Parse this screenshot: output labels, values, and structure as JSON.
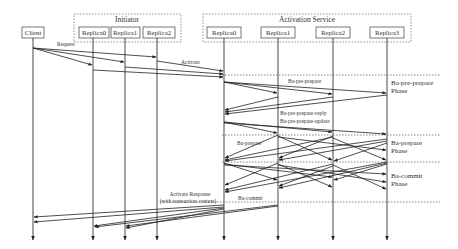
{
  "diagram": {
    "type": "sequence-diagram",
    "groups": {
      "initiator": {
        "title": "Initiator"
      },
      "activation_service": {
        "title": "Activation Service"
      }
    },
    "participants": {
      "client": "Client",
      "init_replica0": "Replica0",
      "init_replica1": "Replica1",
      "init_replica2": "Replica2",
      "act_replica0": "Replica0",
      "act_replica1": "Replica1",
      "act_replica2": "Replica2",
      "act_replica3": "Replica3"
    },
    "messages": {
      "request": "Request",
      "activate": "Activate",
      "ba_pre_prepare": "Ba-pre-prepare",
      "ba_pre_prepare_reply": "Ba-pre-prepare-reply",
      "ba_pre_prepare_update": "Ba-pre-prepare-update",
      "ba_prepare": "Ba-prepare",
      "ba_commit": "Ba-commit",
      "activate_response_line1": "Activate Response",
      "activate_response_line2": "(with transaction context)"
    },
    "phases": {
      "pre_prepare_line1": "Ba-pre-prepare",
      "pre_prepare_line2": "Phase",
      "prepare_line1": "Ba-prepare",
      "prepare_line2": "Phase",
      "commit_line1": "Ba-commit",
      "commit_line2": "Phase"
    }
  }
}
